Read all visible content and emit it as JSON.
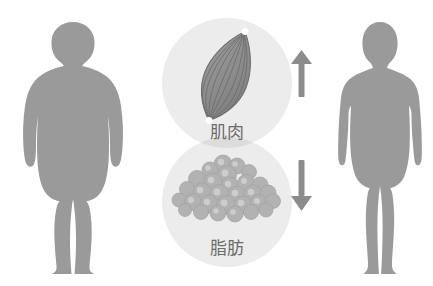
{
  "figure": {
    "type": "infographic",
    "background_color": "#ffffff",
    "body_silhouette_color": "#9a9a9a",
    "circle_background_color": "#ececec",
    "circle_overlap_color": "#d8d8d8",
    "muscle_fill_color": "#8e8e8e",
    "muscle_striation_color": "#6f6f6f",
    "fat_globule_color": "#b0b0b0",
    "fat_globule_highlight_color": "#cfcfcf",
    "arrow_color": "#8c8c8c",
    "label_text_color": "#6b6b6b",
    "tendon_dot_color": "#ffffff"
  },
  "left_figure": {
    "name": "overweight-body-silhouette",
    "description": "obese male body silhouette, front view, arms at sides"
  },
  "right_figure": {
    "name": "slim-body-silhouette",
    "description": "lean male body silhouette, front view, arms at sides"
  },
  "panels": [
    {
      "id": "muscle",
      "label": "肌肉",
      "icon": "muscle-icon",
      "arrow": "up-arrow",
      "arrow_glyph": "↑",
      "meaning": "increase"
    },
    {
      "id": "fat",
      "label": "脂肪",
      "icon": "fat-globules-icon",
      "arrow": "down-arrow",
      "arrow_glyph": "↓",
      "meaning": "decrease"
    }
  ],
  "labels": {
    "muscle": "肌肉",
    "fat": "脂肪"
  }
}
